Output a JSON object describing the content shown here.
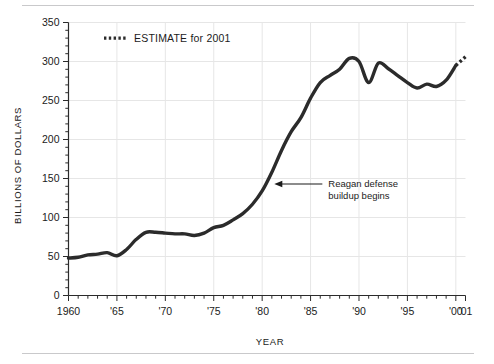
{
  "chart_data": {
    "type": "line",
    "title": "",
    "xlabel": "YEAR",
    "ylabel": "BILLIONS OF DOLLARS",
    "xlim": [
      1960,
      2001
    ],
    "ylim": [
      0,
      350
    ],
    "grid": true,
    "y_ticks": [
      0,
      50,
      100,
      150,
      200,
      250,
      300,
      350
    ],
    "y_tick_labels": [
      "0",
      "50",
      "100",
      "150",
      "200",
      "250",
      "300",
      "350"
    ],
    "y_minor_tick_step": 10,
    "x_ticks": [
      1960,
      1965,
      1970,
      1975,
      1980,
      1985,
      1990,
      1995,
      2000,
      2001
    ],
    "x_tick_labels": [
      "1960",
      "'65",
      "'70",
      "'75",
      "'80",
      "'85",
      "'90",
      "'95",
      "'00",
      "'01"
    ],
    "x_minor_tick_step": 1,
    "legend_position": "top-left",
    "legend": [
      {
        "label": "ESTIMATE for 2001",
        "style": "dotted",
        "color": "#2b2b2b"
      }
    ],
    "annotations": [
      {
        "text_line1": "Reagan defense",
        "text_line2": "buildup begins",
        "points_to_x": 1981,
        "points_to_y": 143
      }
    ],
    "series": [
      {
        "name": "Defense spending",
        "color": "#2b2b2b",
        "style": "solid",
        "x": [
          1960,
          1961,
          1962,
          1963,
          1964,
          1965,
          1966,
          1967,
          1968,
          1969,
          1970,
          1971,
          1972,
          1973,
          1974,
          1975,
          1976,
          1977,
          1978,
          1979,
          1980,
          1981,
          1982,
          1983,
          1984,
          1985,
          1986,
          1987,
          1988,
          1989,
          1990,
          1991,
          1992,
          1993,
          1994,
          1995,
          1996,
          1997,
          1998,
          1999,
          2000
        ],
        "y": [
          48,
          49,
          52,
          53,
          55,
          51,
          59,
          72,
          81,
          81,
          80,
          79,
          79,
          77,
          80,
          87,
          90,
          97,
          105,
          117,
          134,
          158,
          186,
          210,
          228,
          253,
          273,
          282,
          290,
          304,
          300,
          273,
          298,
          291,
          282,
          273,
          266,
          271,
          268,
          276,
          295
        ],
        "estimate_segment": {
          "x": [
            2000,
            2001
          ],
          "y": [
            295,
            306
          ],
          "style": "dotted"
        }
      }
    ]
  }
}
